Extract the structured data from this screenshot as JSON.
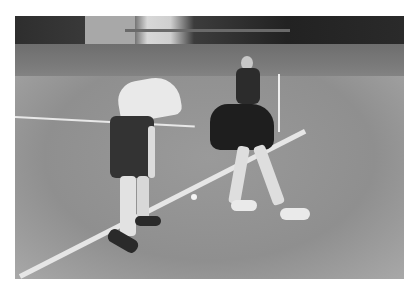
{
  "image": {
    "description": "Black and white photograph of a cricket-style game on a grass field: a batter in white shirt and dark shorts holding a bat, a player in dark top bending over near a white boundary line and ball, and a girl in dark clothing standing in the background near a white stump; trees, a fence and a stone building behind.",
    "palette": {
      "background": "#ffffff",
      "grass": "#8e8e8e",
      "trees": "#2a2a2a",
      "line": "#e6e6e6"
    }
  }
}
